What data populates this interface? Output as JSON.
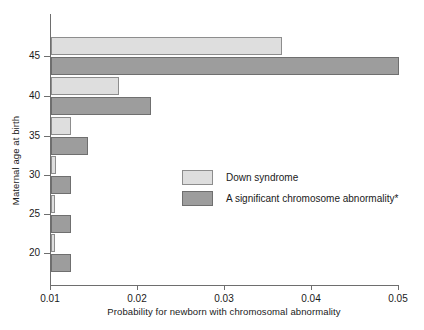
{
  "chart_data": {
    "type": "bar",
    "orientation": "horizontal",
    "title": "",
    "xlabel": "Probability for newborn with chromosomal abnormality",
    "ylabel": "Maternal age at birth",
    "categories": [
      "20",
      "25",
      "30",
      "35",
      "40",
      "45"
    ],
    "xticks": [
      "0.01",
      "0.02",
      "0.03",
      "0.04",
      "0.05"
    ],
    "xtick_values": [
      0.01,
      0.02,
      0.03,
      0.04,
      0.05
    ],
    "yticks": [
      "20",
      "25",
      "30",
      "35",
      "40",
      "45"
    ],
    "xlim": [
      0.01,
      0.05
    ],
    "ylim": [
      17.5,
      47.5
    ],
    "grid": false,
    "legend_position": "center-right",
    "series": [
      {
        "name": "Down syndrome",
        "color": "#dedede",
        "edge_color": "#8d8d8d",
        "values": [
          0.0105,
          0.0105,
          0.0106,
          0.0123,
          0.0178,
          0.0365
        ]
      },
      {
        "name": "A significant chromosome abnormality*",
        "color": "#9d9d9d",
        "edge_color": "#6f6f6f",
        "values": [
          0.0123,
          0.0123,
          0.0123,
          0.0143,
          0.0215,
          0.05
        ]
      }
    ]
  },
  "axes": {
    "x_axis_label": "Probability for newborn with chromosomal abnormality",
    "y_axis_label": "Maternal age at birth"
  },
  "legend": {
    "items": [
      {
        "label": "Down syndrome"
      },
      {
        "label": "A significant chromosome abnormality*"
      }
    ]
  }
}
